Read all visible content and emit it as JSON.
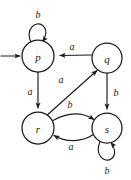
{
  "figure": {
    "kind": "state-transition-diagram",
    "background_color": "#ffffff",
    "ink_color": "#1a1a1a",
    "width": 131,
    "height": 180
  },
  "states": [
    {
      "id": "p",
      "label": "p",
      "cx": 38,
      "cy": 56,
      "r": 16,
      "is_start": true
    },
    {
      "id": "q",
      "label": "q",
      "cx": 107,
      "cy": 58,
      "r": 15,
      "is_start": false
    },
    {
      "id": "r",
      "label": "r",
      "cx": 38,
      "cy": 128,
      "r": 16,
      "is_start": false
    },
    {
      "id": "s",
      "label": "s",
      "cx": 107,
      "cy": 128,
      "r": 15,
      "is_start": false
    }
  ],
  "start_marker": {
    "name": "start-arrow",
    "target": "p"
  },
  "transitions": [
    {
      "id": "p-p",
      "from": "p",
      "to": "p",
      "symbol": "b",
      "shape": "self-loop-top",
      "label_x": 38,
      "label_y": 14
    },
    {
      "id": "q-p",
      "from": "q",
      "to": "p",
      "symbol": "a",
      "shape": "straight-left",
      "label_x": 72,
      "label_y": 48
    },
    {
      "id": "p-r",
      "from": "p",
      "to": "r",
      "symbol": "a",
      "shape": "straight-down",
      "label_x": 30,
      "label_y": 91
    },
    {
      "id": "q-s",
      "from": "q",
      "to": "s",
      "symbol": "b",
      "shape": "straight-down",
      "label_x": 116,
      "label_y": 92
    },
    {
      "id": "r-q",
      "from": "r",
      "to": "q",
      "symbol": "a",
      "shape": "diagonal-up-right",
      "label_x": 61,
      "label_y": 79
    },
    {
      "id": "r-s",
      "from": "r",
      "to": "s",
      "symbol": "b",
      "shape": "curve-top",
      "label_x": 70,
      "label_y": 104
    },
    {
      "id": "s-r",
      "from": "s",
      "to": "r",
      "symbol": "a",
      "shape": "curve-bottom",
      "label_x": 71,
      "label_y": 145
    },
    {
      "id": "s-s",
      "from": "s",
      "to": "s",
      "symbol": "b",
      "shape": "self-loop-bottom",
      "label_x": 107,
      "label_y": 170
    }
  ]
}
